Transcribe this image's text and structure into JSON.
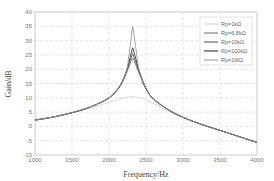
{
  "chart_data": {
    "type": "line",
    "title": "",
    "xlabel": "Frequency/Hz",
    "ylabel": "Gain/dB",
    "xlim": [
      1000,
      4000
    ],
    "ylim": [
      -10,
      40
    ],
    "xticks": [
      1000,
      1500,
      2000,
      2500,
      3000,
      3500,
      4000
    ],
    "yticks": [
      -10,
      -5,
      0,
      5,
      10,
      15,
      20,
      25,
      30,
      35,
      40
    ],
    "grid": true,
    "legend_position": "upper right",
    "series": [
      {
        "name": "Rp=1kΩ",
        "color": "#d6d6d6",
        "peak_freq": 2300,
        "peak_gain": 10.5,
        "x": [
          1000,
          1250,
          1500,
          1750,
          2000,
          2150,
          2300,
          2450,
          2600,
          2800,
          3000,
          3250,
          3500,
          3750,
          4000
        ],
        "y": [
          2.2,
          3.2,
          4.6,
          6.3,
          8.4,
          9.6,
          10.4,
          9.7,
          8.0,
          5.3,
          3.0,
          0.6,
          -1.4,
          -3.5,
          -5.6
        ]
      },
      {
        "name": "Rp=6.8kΩ",
        "color": "#7a7a7a",
        "peak_freq": 2320,
        "peak_gain": 24,
        "x": [
          1000,
          1250,
          1500,
          1750,
          2000,
          2150,
          2250,
          2320,
          2400,
          2500,
          2600,
          2800,
          3000,
          3250,
          3500,
          3750,
          4000
        ],
        "y": [
          2.2,
          3.3,
          4.8,
          6.8,
          10.0,
          14.0,
          19.5,
          24.0,
          19.0,
          13.0,
          9.5,
          5.8,
          3.2,
          0.7,
          -1.4,
          -3.5,
          -5.6
        ]
      },
      {
        "name": "Rp=10kΩ",
        "color": "#5a5a5a",
        "peak_freq": 2320,
        "peak_gain": 25.5,
        "x": [
          1000,
          1250,
          1500,
          1750,
          2000,
          2150,
          2250,
          2320,
          2400,
          2500,
          2600,
          2800,
          3000,
          3250,
          3500,
          3750,
          4000
        ],
        "y": [
          2.2,
          3.3,
          4.8,
          6.8,
          10.0,
          14.2,
          20.0,
          25.5,
          19.5,
          13.2,
          9.6,
          5.8,
          3.2,
          0.7,
          -1.4,
          -3.5,
          -5.6
        ]
      },
      {
        "name": "Rp=100kΩ",
        "color": "#303030",
        "peak_freq": 2320,
        "peak_gain": 27.5,
        "x": [
          1000,
          1250,
          1500,
          1750,
          2000,
          2150,
          2250,
          2320,
          2400,
          2500,
          2600,
          2800,
          3000,
          3250,
          3500,
          3750,
          4000
        ],
        "y": [
          2.2,
          3.3,
          4.8,
          6.8,
          10.0,
          14.3,
          20.5,
          27.5,
          20.0,
          13.3,
          9.7,
          5.9,
          3.2,
          0.7,
          -1.4,
          -3.5,
          -5.6
        ]
      },
      {
        "name": "Rp=1MΩ",
        "color": "#9a9a9a",
        "peak_freq": 2320,
        "peak_gain": 35,
        "x": [
          1000,
          1250,
          1500,
          1750,
          2000,
          2150,
          2250,
          2320,
          2400,
          2500,
          2600,
          2800,
          3000,
          3250,
          3500,
          3750,
          4000
        ],
        "y": [
          2.2,
          3.3,
          4.8,
          6.8,
          10.0,
          14.4,
          21.0,
          35.0,
          20.5,
          13.4,
          9.7,
          5.9,
          3.2,
          0.7,
          -1.4,
          -3.5,
          -5.6
        ]
      }
    ]
  },
  "axes": {
    "xlabel": "Frequency/Hz",
    "ylabel": "Gain/dB"
  },
  "legend": {
    "items": [
      "Rp=1kΩ",
      "Rp=6.8kΩ",
      "Rp=10kΩ",
      "Rp=100kΩ",
      "Rp=1MΩ"
    ]
  }
}
